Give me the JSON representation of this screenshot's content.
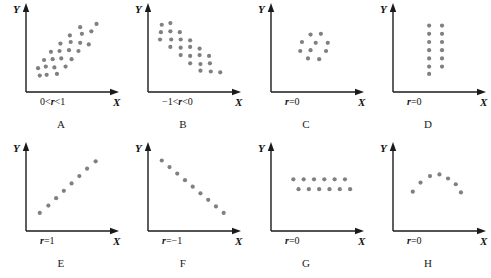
{
  "figure": {
    "dot_color": "#808080",
    "axis_color": "#1a1a1a",
    "background": "#ffffff",
    "axis_labels": {
      "x": "X",
      "y": "Y"
    }
  },
  "chart_data": {
    "type": "scatter",
    "xlabel": "X",
    "ylabel": "Y",
    "xlim": [
      0,
      10
    ],
    "ylim": [
      0,
      10
    ],
    "grid": false,
    "legend": "none",
    "panels": [
      {
        "id": "A",
        "caption": "A",
        "annotation": "0<r<1",
        "r_prefix": "",
        "r_text": "0<r<1",
        "description": "positive linear scatter cloud",
        "points": [
          [
            1.6,
            2.0
          ],
          [
            2.4,
            2.1
          ],
          [
            3.6,
            2.2
          ],
          [
            1.4,
            2.9
          ],
          [
            2.3,
            3.1
          ],
          [
            3.3,
            3.0
          ],
          [
            4.6,
            3.1
          ],
          [
            2.1,
            3.9
          ],
          [
            3.1,
            4.0
          ],
          [
            4.1,
            4.1
          ],
          [
            5.3,
            4.0
          ],
          [
            2.9,
            4.9
          ],
          [
            3.9,
            5.0
          ],
          [
            5.0,
            5.1
          ],
          [
            6.1,
            5.0
          ],
          [
            4.0,
            5.9
          ],
          [
            5.2,
            6.1
          ],
          [
            6.3,
            6.0
          ],
          [
            7.3,
            5.8
          ],
          [
            5.1,
            6.9
          ],
          [
            6.5,
            7.1
          ],
          [
            7.6,
            7.4
          ],
          [
            6.3,
            7.9
          ],
          [
            8.2,
            8.3
          ]
        ]
      },
      {
        "id": "B",
        "caption": "B",
        "annotation": "-1<r<0",
        "r_prefix": "",
        "r_text": "−1<r<0",
        "description": "negative linear scatter cloud",
        "points": [
          [
            1.6,
            8.2
          ],
          [
            2.6,
            8.4
          ],
          [
            1.5,
            7.3
          ],
          [
            2.6,
            7.4
          ],
          [
            3.7,
            7.3
          ],
          [
            1.4,
            6.4
          ],
          [
            2.7,
            6.4
          ],
          [
            3.8,
            6.4
          ],
          [
            4.9,
            6.3
          ],
          [
            2.6,
            5.5
          ],
          [
            3.8,
            5.4
          ],
          [
            4.9,
            5.5
          ],
          [
            6.0,
            5.3
          ],
          [
            3.8,
            4.5
          ],
          [
            4.9,
            4.4
          ],
          [
            6.0,
            4.5
          ],
          [
            7.1,
            4.4
          ],
          [
            4.9,
            3.5
          ],
          [
            6.1,
            3.4
          ],
          [
            7.2,
            3.5
          ],
          [
            6.1,
            2.6
          ],
          [
            7.3,
            2.5
          ],
          [
            8.4,
            2.4
          ]
        ]
      },
      {
        "id": "C",
        "caption": "C",
        "annotation": "r=0",
        "r_prefix": "r",
        "r_text": "r=0",
        "description": "circular ring cluster, no correlation",
        "points": [
          [
            4.6,
            7.0
          ],
          [
            5.8,
            7.1
          ],
          [
            3.6,
            6.1
          ],
          [
            5.2,
            6.0
          ],
          [
            6.6,
            6.0
          ],
          [
            3.4,
            5.0
          ],
          [
            4.6,
            5.1
          ],
          [
            6.4,
            5.0
          ],
          [
            4.3,
            4.1
          ],
          [
            5.6,
            4.0
          ]
        ]
      },
      {
        "id": "D",
        "caption": "D",
        "annotation": "r=0",
        "r_prefix": "r",
        "r_text": "r=0",
        "description": "two vertical columns of points, no correlation",
        "points": [
          [
            4.2,
            8.1
          ],
          [
            4.2,
            7.1
          ],
          [
            4.2,
            6.1
          ],
          [
            4.2,
            5.1
          ],
          [
            4.2,
            4.1
          ],
          [
            4.2,
            3.1
          ],
          [
            4.2,
            2.2
          ],
          [
            5.7,
            8.1
          ],
          [
            5.7,
            7.1
          ],
          [
            5.7,
            6.1
          ],
          [
            5.7,
            5.1
          ],
          [
            5.7,
            4.1
          ],
          [
            5.7,
            3.1
          ]
        ]
      },
      {
        "id": "E",
        "caption": "E",
        "annotation": "r=1",
        "r_prefix": "r",
        "r_text": "r=1",
        "description": "perfect positive linear relationship",
        "points": [
          [
            1.6,
            2.2
          ],
          [
            2.6,
            3.1
          ],
          [
            3.5,
            4.0
          ],
          [
            4.4,
            4.9
          ],
          [
            5.3,
            5.8
          ],
          [
            6.2,
            6.7
          ],
          [
            7.1,
            7.6
          ],
          [
            8.1,
            8.5
          ]
        ]
      },
      {
        "id": "F",
        "caption": "F",
        "annotation": "r=-1",
        "r_prefix": "r",
        "r_text": "r=−1",
        "description": "perfect negative linear relationship",
        "points": [
          [
            1.6,
            8.6
          ],
          [
            2.5,
            7.8
          ],
          [
            3.4,
            7.0
          ],
          [
            4.3,
            6.2
          ],
          [
            5.2,
            5.4
          ],
          [
            6.1,
            4.6
          ],
          [
            7.0,
            3.8
          ],
          [
            7.9,
            3.0
          ],
          [
            8.8,
            2.2
          ]
        ]
      },
      {
        "id": "G",
        "caption": "G",
        "annotation": "r=0",
        "r_prefix": "r",
        "r_text": "r=0",
        "description": "two horizontal rows of points, no correlation",
        "points": [
          [
            2.6,
            6.3
          ],
          [
            3.8,
            6.3
          ],
          [
            5.0,
            6.3
          ],
          [
            6.2,
            6.3
          ],
          [
            7.4,
            6.3
          ],
          [
            8.6,
            6.3
          ],
          [
            3.2,
            5.1
          ],
          [
            4.4,
            5.1
          ],
          [
            5.6,
            5.1
          ],
          [
            6.8,
            5.1
          ],
          [
            8.0,
            5.1
          ],
          [
            9.2,
            5.1
          ]
        ]
      },
      {
        "id": "H",
        "caption": "H",
        "annotation": "r=0",
        "r_prefix": "r",
        "r_text": "r=0",
        "description": "inverted U curved relationship, zero linear correlation",
        "points": [
          [
            2.3,
            4.8
          ],
          [
            3.2,
            5.9
          ],
          [
            4.3,
            6.7
          ],
          [
            5.4,
            6.9
          ],
          [
            6.4,
            6.4
          ],
          [
            7.3,
            5.7
          ],
          [
            7.9,
            4.7
          ]
        ]
      }
    ]
  }
}
